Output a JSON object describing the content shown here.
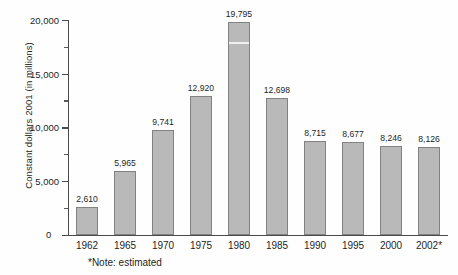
{
  "chart_data": {
    "type": "bar",
    "title": "",
    "xlabel": "",
    "ylabel": "Constant dollars 2001 (in millions)",
    "categories": [
      "1962",
      "1965",
      "1970",
      "1975",
      "1980",
      "1985",
      "1990",
      "1995",
      "2000",
      "2002*"
    ],
    "values": [
      2610,
      5965,
      9741,
      12920,
      19795,
      12698,
      8715,
      8677,
      8246,
      8126
    ],
    "value_labels": [
      "2,610",
      "5,965",
      "9,741",
      "12,920",
      "19,795",
      "12,698",
      "8,715",
      "8,677",
      "8,246",
      "8,126"
    ],
    "ylim": [
      0,
      20000
    ],
    "ytick_values": [
      0,
      5000,
      10000,
      15000,
      20000
    ],
    "ytick_labels": [
      "0",
      "5,000",
      "10,000",
      "15,000",
      "20,000"
    ],
    "yminor_tick_values": [
      2500,
      7500,
      12500,
      17500
    ],
    "grid": false,
    "legend": null,
    "annotations": [
      "*Note: estimated"
    ],
    "bar_color": "#b9b9b9",
    "bar_border_color": "#828282",
    "axis_color": "#4a4a4a",
    "text_color": "#1f1f1f"
  },
  "footnote": "*Note: estimated",
  "y_axis_title": "Constant dollars 2001 (in millions)"
}
